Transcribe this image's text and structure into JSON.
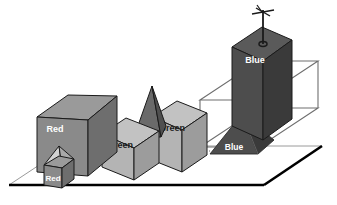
{
  "figure": {
    "background_color": "#ffffff",
    "projection": "axonometric"
  },
  "palette": {
    "face_front_mid": "#8a8a8a",
    "face_top_mid": "#9a9a9a",
    "face_side_dark": "#6e6e6e",
    "face_front_light": "#b4b4b4",
    "face_top_light": "#c2c2c2",
    "face_side_light": "#9c9c9c",
    "face_front_dark": "#4d4d4d",
    "face_top_dark": "#5a5a5a",
    "face_side_darkest": "#3a3a3a",
    "pyramid_light": "#d2d2d2",
    "pyramid_dark": "#6a6a6a",
    "ground_fill": "#ffffff",
    "ground_edge_thick": "#000000",
    "ground_edge_thin": "#9a9a9a",
    "wireframe": "#6e6e6e",
    "outline": "#000000",
    "label_light_text": "#ffffff",
    "label_dark_text": "#1a1a1a"
  },
  "ground_plane": {
    "name": "ground-plane",
    "thick_edge_side": "bottom-right",
    "thin_edge_side": "top-left"
  },
  "wireframe_box": {
    "name": "bounding-box-wireframe",
    "label": "",
    "stroke_color": "#6e6e6e"
  },
  "antenna": {
    "name": "antenna",
    "type": "weather-vane",
    "color": "#1a1a1a",
    "has_crossbar": true,
    "has_base_ring": true
  },
  "objects": [
    {
      "id": "box-red-large",
      "label": "Red",
      "shape": "box",
      "tone": "mid",
      "label_text_color": "#ffffff"
    },
    {
      "id": "box-red-small",
      "label": "Red",
      "shape": "box-with-pyramid-roof",
      "tone": "mid",
      "label_text_color": "#ffffff"
    },
    {
      "id": "pyramid-red-small-roof",
      "label": "",
      "shape": "pyramid",
      "tone": "light",
      "label_text_color": "#1a1a1a"
    },
    {
      "id": "box-green-left",
      "label": "Green",
      "shape": "box",
      "tone": "light",
      "label_text_color": "#1a1a1a"
    },
    {
      "id": "pyramid-red-tall",
      "label": "Red",
      "shape": "pyramid",
      "tone": "dark",
      "label_text_color": "#ffffff"
    },
    {
      "id": "box-green-right",
      "label": "Green",
      "shape": "box",
      "tone": "light",
      "label_text_color": "#1a1a1a"
    },
    {
      "id": "pyramid-blue",
      "label": "Blue",
      "shape": "pyramid",
      "tone": "dark",
      "label_text_color": "#ffffff"
    },
    {
      "id": "box-blue-tower",
      "label": "Blue",
      "shape": "box",
      "tone": "dark",
      "label_text_color": "#ffffff"
    }
  ],
  "labels": {
    "red_large": "Red",
    "red_small": "Red",
    "green_left": "Green",
    "red_tall_pyramid": "Red",
    "green_right": "Green",
    "blue_pyramid": "Blue",
    "blue_tower": "Blue"
  }
}
